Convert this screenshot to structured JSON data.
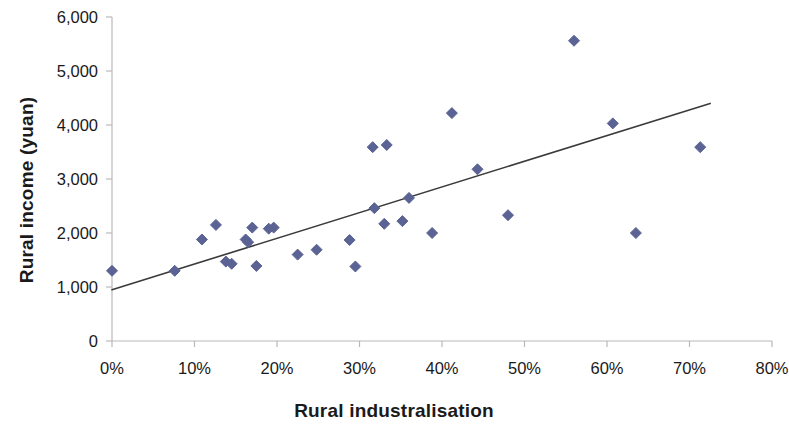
{
  "chart_data": {
    "type": "scatter",
    "title": "",
    "xlabel": "Rural industralisation",
    "ylabel": "Rural income (yuan)",
    "xlim": [
      0,
      80
    ],
    "ylim": [
      0,
      6000
    ],
    "x_tick_labels": [
      "0%",
      "10%",
      "20%",
      "30%",
      "40%",
      "50%",
      "60%",
      "70%",
      "80%"
    ],
    "x_tick_values": [
      0,
      10,
      20,
      30,
      40,
      50,
      60,
      70,
      80
    ],
    "y_tick_labels": [
      "0",
      "1,000",
      "2,000",
      "3,000",
      "4,000",
      "5,000",
      "6,000"
    ],
    "y_tick_values": [
      0,
      1000,
      2000,
      3000,
      4000,
      5000,
      6000
    ],
    "x_unit": "%",
    "grid": false,
    "legend": false,
    "marker": "diamond",
    "marker_color": "#5b6394",
    "marker_size": 11,
    "trendline": {
      "type": "linear",
      "color": "#3a3a3a",
      "width": 1.6,
      "x_start": 0,
      "y_start": 950,
      "x_end": 72.5,
      "y_end": 4400
    },
    "axis_color": "#b9b9b9",
    "series": [
      {
        "name": "Counties",
        "points": [
          {
            "x": 0.0,
            "y": 1300
          },
          {
            "x": 7.6,
            "y": 1300
          },
          {
            "x": 10.9,
            "y": 1880
          },
          {
            "x": 12.6,
            "y": 2150
          },
          {
            "x": 13.8,
            "y": 1470
          },
          {
            "x": 14.5,
            "y": 1430
          },
          {
            "x": 16.2,
            "y": 1880
          },
          {
            "x": 16.5,
            "y": 1830
          },
          {
            "x": 17.0,
            "y": 2100
          },
          {
            "x": 17.5,
            "y": 1390
          },
          {
            "x": 19.0,
            "y": 2080
          },
          {
            "x": 19.6,
            "y": 2100
          },
          {
            "x": 22.5,
            "y": 1600
          },
          {
            "x": 24.8,
            "y": 1690
          },
          {
            "x": 28.8,
            "y": 1870
          },
          {
            "x": 29.5,
            "y": 1380
          },
          {
            "x": 31.6,
            "y": 3590
          },
          {
            "x": 31.8,
            "y": 2460
          },
          {
            "x": 33.3,
            "y": 3630
          },
          {
            "x": 33.0,
            "y": 2170
          },
          {
            "x": 35.2,
            "y": 2220
          },
          {
            "x": 36.0,
            "y": 2650
          },
          {
            "x": 38.8,
            "y": 2000
          },
          {
            "x": 41.2,
            "y": 4220
          },
          {
            "x": 44.3,
            "y": 3180
          },
          {
            "x": 48.0,
            "y": 2330
          },
          {
            "x": 56.0,
            "y": 5560
          },
          {
            "x": 60.7,
            "y": 4030
          },
          {
            "x": 63.5,
            "y": 2000
          },
          {
            "x": 71.3,
            "y": 3590
          }
        ]
      }
    ]
  },
  "axes": {
    "x_title": "Rural industralisation",
    "y_title": "Rural income (yuan)"
  }
}
